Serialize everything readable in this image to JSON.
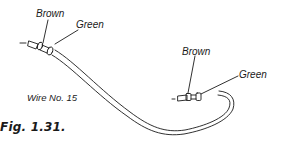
{
  "figure": {
    "caption": "Fig. 1.31.",
    "wire_label": "Wire No. 15",
    "left_end": {
      "outer_label": "Brown",
      "inner_label": "Green"
    },
    "right_end": {
      "outer_label": "Brown",
      "inner_label": "Green"
    },
    "line_color": "#1a1a1a",
    "background": "#ffffff"
  }
}
